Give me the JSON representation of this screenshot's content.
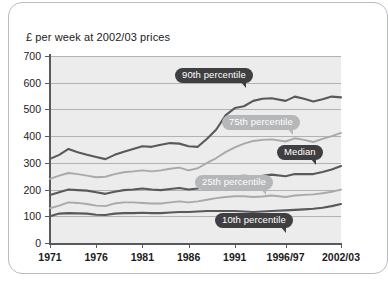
{
  "chart_data": {
    "type": "line",
    "title": "£ per week at 2002/03 prices",
    "xlabel": "",
    "ylabel": "",
    "ylim": [
      0,
      700
    ],
    "yticks": [
      0,
      100,
      200,
      300,
      400,
      500,
      600,
      700
    ],
    "xtick_labels": [
      "1971",
      "1976",
      "1981",
      "1986",
      "1991",
      "1996/97",
      "2002/03"
    ],
    "xtick_values": [
      1971,
      1976,
      1981,
      1986,
      1991,
      1996.5,
      2002.5
    ],
    "xlim": [
      1971,
      2002.5
    ],
    "grid": true,
    "legend": "inline-callouts",
    "colors": {
      "dark_line": "#58595b",
      "light_line": "#a7a9ac",
      "plot_background": "#ececed",
      "gridline": "#b0b2b4",
      "axis": "#58595b",
      "callout_dark": "#3f3f42",
      "callout_light": "#b5b7b9"
    },
    "x": [
      1971,
      1972,
      1973,
      1974,
      1975,
      1976,
      1977,
      1978,
      1979,
      1980,
      1981,
      1982,
      1983,
      1984,
      1985,
      1986,
      1987,
      1988,
      1989,
      1990,
      1991,
      1992,
      1993,
      1994,
      1995,
      1996.5,
      1997.5,
      1998.5,
      1999.5,
      2000.5,
      2001.5,
      2002.5
    ],
    "series": [
      {
        "name": "90th percentile",
        "style": "dark",
        "values": [
          315,
          330,
          352,
          340,
          330,
          322,
          314,
          330,
          342,
          352,
          362,
          360,
          368,
          374,
          372,
          362,
          360,
          390,
          425,
          478,
          505,
          512,
          532,
          540,
          542,
          532,
          548,
          540,
          530,
          538,
          548,
          545
        ]
      },
      {
        "name": "75th percentile",
        "style": "light",
        "values": [
          240,
          252,
          262,
          258,
          252,
          246,
          248,
          258,
          265,
          268,
          272,
          268,
          272,
          278,
          282,
          272,
          280,
          300,
          318,
          340,
          358,
          372,
          382,
          386,
          388,
          380,
          392,
          386,
          378,
          390,
          400,
          412
        ]
      },
      {
        "name": "Median",
        "style": "dark",
        "values": [
          180,
          190,
          200,
          198,
          196,
          190,
          184,
          192,
          198,
          200,
          204,
          200,
          198,
          202,
          206,
          200,
          204,
          215,
          230,
          245,
          250,
          252,
          250,
          252,
          256,
          250,
          258,
          258,
          258,
          266,
          275,
          288
        ]
      },
      {
        "name": "25th percentile",
        "style": "light",
        "values": [
          130,
          140,
          152,
          150,
          146,
          140,
          138,
          148,
          152,
          152,
          150,
          148,
          148,
          152,
          156,
          152,
          156,
          162,
          168,
          172,
          175,
          175,
          172,
          174,
          178,
          172,
          178,
          180,
          182,
          186,
          192,
          200
        ]
      },
      {
        "name": "10th percentile",
        "style": "dark",
        "values": [
          100,
          110,
          112,
          111,
          110,
          106,
          105,
          110,
          112,
          112,
          113,
          112,
          112,
          114,
          116,
          116,
          118,
          120,
          120,
          120,
          120,
          118,
          116,
          118,
          120,
          122,
          124,
          126,
          128,
          132,
          138,
          146
        ]
      }
    ],
    "callouts": [
      {
        "label": "90th percentile",
        "style": "dark",
        "x_px": 175,
        "y_px": 68
      },
      {
        "label": "75th percentile",
        "style": "light",
        "x_px": 222,
        "y_px": 115
      },
      {
        "label": "Median",
        "style": "dark",
        "x_px": 277,
        "y_px": 145
      },
      {
        "label": "25th percentile",
        "style": "light",
        "x_px": 195,
        "y_px": 175
      },
      {
        "label": "10th percentile",
        "style": "dark",
        "x_px": 215,
        "y_px": 213
      }
    ]
  }
}
